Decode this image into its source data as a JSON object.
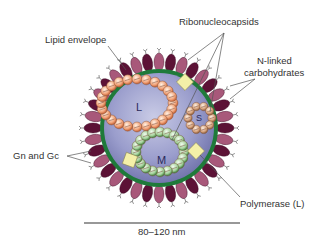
{
  "diagram": {
    "labels": {
      "lipid_envelope": "Lipid envelope",
      "ribonucleocapsids": "Ribonucleocapsids",
      "n_linked_line1": "N-linked",
      "n_linked_line2": "carbohydrates",
      "gn_gc": "Gn and Gc",
      "polymerase": "Polymerase (L)"
    },
    "segments": {
      "large": "L",
      "medium": "M",
      "small": "S"
    },
    "scale_bar": {
      "label": "80–120 nm"
    },
    "colors": {
      "virion_interior": "#8f93c4",
      "membrane": "#1f7a3a",
      "glycoprotein_dark": "#5c1236",
      "glycoprotein_light": "#a8587a",
      "l_segment": "#f0a070",
      "m_segment": "#a9d3a0",
      "s_segment": "#d9a882",
      "polymerase": "#f4f0a8"
    }
  }
}
